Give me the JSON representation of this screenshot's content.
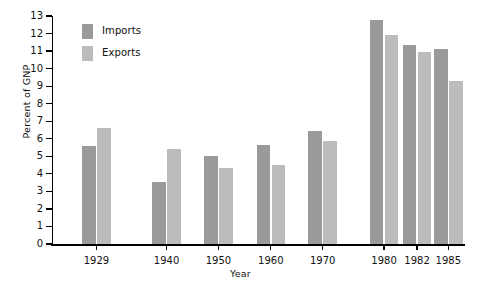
{
  "chart_data": {
    "type": "bar",
    "title": "",
    "subtitle": "",
    "xlabel": "Year",
    "ylabel": "Percent of GNP",
    "categories": [
      "1929",
      "1940",
      "1950",
      "1960",
      "1970",
      "1980",
      "1982",
      "1985"
    ],
    "series": [
      {
        "name": "Imports",
        "color": "#9a9a9a",
        "values": [
          5.6,
          3.55,
          5.0,
          5.65,
          6.45,
          12.8,
          11.35,
          11.1
        ]
      },
      {
        "name": "Exports",
        "color": "#bcbcbc",
        "values": [
          6.6,
          5.4,
          4.35,
          4.5,
          5.9,
          11.9,
          10.95,
          9.3
        ]
      }
    ],
    "ylim": [
      0,
      13
    ],
    "yticks": [
      0,
      1,
      2,
      3,
      4,
      5,
      6,
      7,
      8,
      9,
      10,
      11,
      12,
      13
    ],
    "ytick_labels": [
      "0",
      "1",
      "2",
      "3",
      "4",
      "5",
      "6",
      "7",
      "8",
      "9",
      "10",
      "11",
      "12",
      "13"
    ],
    "grid": false,
    "legend_position": "upper left",
    "legend_entries": [
      "Imports",
      "Exports"
    ],
    "group_centers_frac": [
      0.108,
      0.278,
      0.404,
      0.531,
      0.657,
      0.806,
      0.886,
      0.962
    ]
  }
}
